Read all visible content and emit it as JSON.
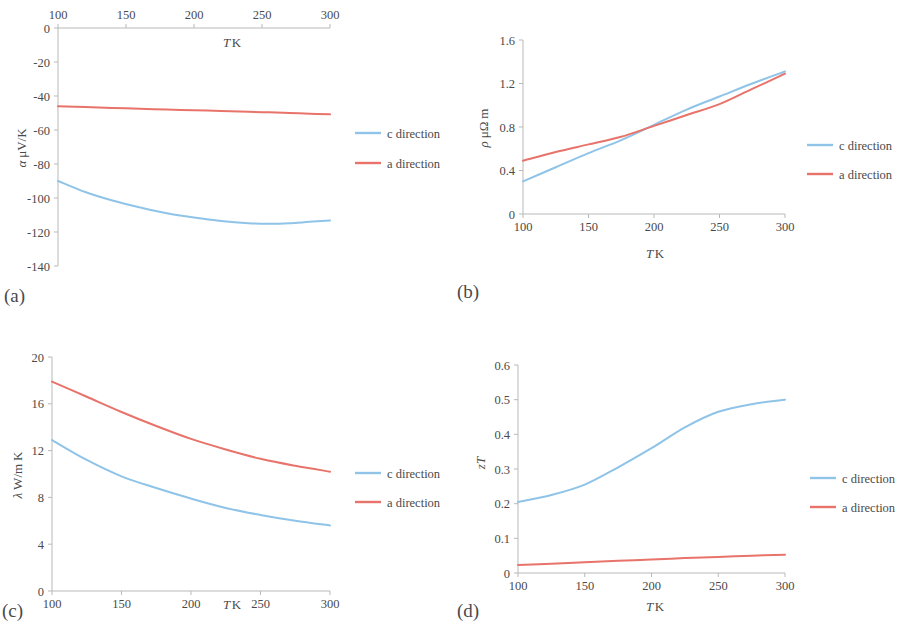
{
  "figure": {
    "panel_tags": [
      "(a)",
      "(b)",
      "(c)",
      "(d)"
    ],
    "series_names": [
      "c direction",
      "a direction"
    ],
    "colors": {
      "c_direction": "#8FC4E8",
      "a_direction": "#E8736A",
      "axis": "#b9b9b9",
      "text": "#4a4a4a"
    }
  },
  "chart_data": [
    {
      "panel": "(a)",
      "type": "line",
      "title": "",
      "xlabel": "T K",
      "ylabel": "α μV/K",
      "xlim": [
        100,
        300
      ],
      "ylim": [
        -140,
        0
      ],
      "xticks": [
        100,
        150,
        200,
        250,
        300
      ],
      "yticks": [
        0,
        -20,
        -40,
        -60,
        -80,
        -100,
        -120,
        -140
      ],
      "xtick_labels": [
        "100",
        "150",
        "200",
        "250",
        "300"
      ],
      "ytick_labels": [
        "0",
        "-20",
        "-40",
        "-60",
        "-80",
        "-100",
        "-120",
        "-140"
      ],
      "x_axis_position": "top",
      "grid": false,
      "legend_position": "right",
      "x": [
        100,
        120,
        140,
        160,
        180,
        200,
        220,
        240,
        255,
        270,
        285,
        300
      ],
      "series": [
        {
          "name": "c direction",
          "color": "#8FC4E8",
          "values": [
            -90.0,
            -96.5,
            -101.5,
            -105.5,
            -109.0,
            -111.5,
            -113.5,
            -114.8,
            -115.2,
            -114.9,
            -114.0,
            -113.2
          ]
        },
        {
          "name": "a direction",
          "color": "#E8736A",
          "values": [
            -46.0,
            -46.5,
            -47.0,
            -47.5,
            -48.0,
            -48.4,
            -48.8,
            -49.3,
            -49.6,
            -50.0,
            -50.4,
            -50.8
          ]
        }
      ]
    },
    {
      "panel": "(b)",
      "type": "line",
      "title": "",
      "xlabel": "T K",
      "ylabel": "ρ μΩ m",
      "xlim": [
        100,
        300
      ],
      "ylim": [
        0,
        1.6
      ],
      "xticks": [
        100,
        150,
        200,
        250,
        300
      ],
      "yticks": [
        0,
        0.4,
        0.8,
        1.2,
        1.6
      ],
      "xtick_labels": [
        "100",
        "150",
        "200",
        "250",
        "300"
      ],
      "ytick_labels": [
        "0",
        "0.4",
        "0.8",
        "1.2",
        "1.6"
      ],
      "x_axis_position": "bottom",
      "grid": false,
      "legend_position": "right",
      "x": [
        100,
        125,
        150,
        175,
        200,
        225,
        250,
        275,
        300
      ],
      "series": [
        {
          "name": "c direction",
          "color": "#8FC4E8",
          "values": [
            0.3,
            0.43,
            0.56,
            0.68,
            0.82,
            0.96,
            1.08,
            1.2,
            1.31
          ]
        },
        {
          "name": "a direction",
          "color": "#E8736A",
          "values": [
            0.49,
            0.57,
            0.64,
            0.71,
            0.81,
            0.91,
            1.01,
            1.15,
            1.29
          ]
        }
      ]
    },
    {
      "panel": "(c)",
      "type": "line",
      "title": "",
      "xlabel": "T K",
      "ylabel": "λ W/m K",
      "xlim": [
        100,
        300
      ],
      "ylim": [
        0,
        20
      ],
      "xticks": [
        100,
        150,
        200,
        250,
        300
      ],
      "yticks": [
        0,
        4,
        8,
        12,
        16,
        20
      ],
      "xtick_labels": [
        "100",
        "150",
        "200",
        "250",
        "300"
      ],
      "ytick_labels": [
        "0",
        "4",
        "8",
        "12",
        "16",
        "20"
      ],
      "x_axis_position": "bottom",
      "grid": false,
      "legend_position": "right",
      "x": [
        100,
        125,
        150,
        175,
        200,
        225,
        250,
        275,
        300
      ],
      "series": [
        {
          "name": "c direction",
          "color": "#8FC4E8",
          "values": [
            12.9,
            11.2,
            9.8,
            8.8,
            7.9,
            7.1,
            6.5,
            6.0,
            5.6
          ]
        },
        {
          "name": "a direction",
          "color": "#E8736A",
          "values": [
            17.9,
            16.6,
            15.3,
            14.1,
            13.0,
            12.1,
            11.3,
            10.7,
            10.2
          ]
        }
      ]
    },
    {
      "panel": "(d)",
      "type": "line",
      "title": "",
      "xlabel": "T K",
      "ylabel": "zT",
      "xlim": [
        100,
        300
      ],
      "ylim": [
        0,
        0.6
      ],
      "xticks": [
        100,
        150,
        200,
        250,
        300
      ],
      "yticks": [
        0,
        0.1,
        0.2,
        0.3,
        0.4,
        0.5,
        0.6
      ],
      "xtick_labels": [
        "100",
        "150",
        "200",
        "250",
        "300"
      ],
      "ytick_labels": [
        "0",
        "0.1",
        "0.2",
        "0.3",
        "0.4",
        "0.5",
        "0.6"
      ],
      "x_axis_position": "bottom",
      "grid": false,
      "legend_position": "right",
      "x": [
        100,
        125,
        150,
        175,
        200,
        225,
        250,
        275,
        300
      ],
      "series": [
        {
          "name": "c direction",
          "color": "#8FC4E8",
          "values": [
            0.205,
            0.225,
            0.255,
            0.305,
            0.36,
            0.42,
            0.465,
            0.487,
            0.5
          ]
        },
        {
          "name": "a direction",
          "color": "#E8736A",
          "values": [
            0.023,
            0.027,
            0.031,
            0.035,
            0.039,
            0.043,
            0.046,
            0.05,
            0.053
          ]
        }
      ]
    }
  ]
}
